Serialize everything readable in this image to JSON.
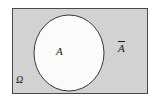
{
  "figure": {
    "kind": "venn-diagram",
    "universal_set": {
      "label": "Ω",
      "label_name": "omega",
      "shape": "rectangle",
      "fill_color": "#d2d2d2",
      "border_color": "#4a4a4a",
      "x": 12,
      "y": 8,
      "width": 136,
      "height": 86
    },
    "set_a": {
      "label": "A",
      "shape": "circle",
      "fill_color": "#fbfbfb",
      "border_color": "#3a3a3a",
      "center_x": 69,
      "center_y": 53,
      "radius_x": 35,
      "radius_y": 38
    },
    "complement": {
      "label": "A",
      "overline": true,
      "label_text": "Ā",
      "region": "shaded area inside rectangle, outside circle"
    },
    "background_color": "#ffffff"
  }
}
